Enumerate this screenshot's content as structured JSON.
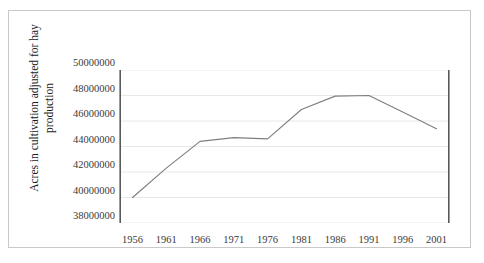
{
  "chart_data": {
    "type": "line",
    "title": "",
    "subtitle": "",
    "xlabel": "",
    "ylabel": "Acres in cultivation adjusted for hay production",
    "x": [
      1956,
      1961,
      1966,
      1971,
      1976,
      1981,
      1986,
      1991,
      1996,
      2001
    ],
    "values": [
      40000000,
      42300000,
      44400000,
      44700000,
      44600000,
      46900000,
      47950000,
      48000000,
      46700000,
      45400000
    ],
    "series": [
      {
        "name": "Acres in cultivation adjusted for hay production",
        "values": [
          40000000,
          42300000,
          44400000,
          44700000,
          44600000,
          46900000,
          47950000,
          48000000,
          46700000,
          45400000
        ]
      }
    ],
    "xlim": [
      1954,
      2003
    ],
    "ylim": [
      38000000,
      50000000
    ],
    "ytick_labels": [
      "50000000",
      "48000000",
      "46000000",
      "44000000",
      "42000000",
      "40000000",
      "38000000"
    ],
    "ytick_values": [
      50000000,
      48000000,
      46000000,
      44000000,
      42000000,
      40000000,
      38000000
    ],
    "xtick_labels": [
      "1956",
      "1961",
      "1966",
      "1971",
      "1976",
      "1981",
      "1986",
      "1991",
      "1996",
      "2001"
    ],
    "xtick_values": [
      1956,
      1961,
      1966,
      1971,
      1976,
      1981,
      1986,
      1991,
      1996,
      2001
    ],
    "grid": "horizontal",
    "legend": "none",
    "line_color": "#7f7f7f",
    "gridline_color": "#e8e8e8",
    "axis_color": "#595959",
    "frame_color": "#c9c9c9"
  }
}
